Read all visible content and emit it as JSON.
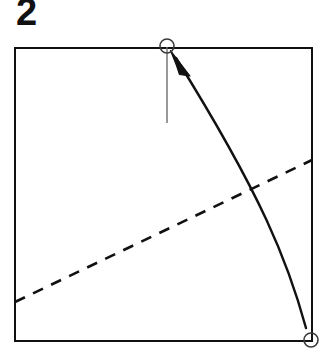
{
  "figure": {
    "step_label": "2",
    "background_color": "#ffffff",
    "ink_color": "#111111",
    "guide_color": "#777777"
  },
  "chart_data": {
    "type": "diagram",
    "coordinate_space": {
      "width": 327,
      "height": 363
    },
    "elements": [
      {
        "id": "paper-square",
        "name": "paper-square",
        "kind": "rectangle",
        "x": 15,
        "y": 48,
        "width": 297,
        "height": 293,
        "stroke": "#111111",
        "stroke_width": 2.4,
        "fill": "none"
      },
      {
        "id": "fold-line-dashed",
        "name": "dashed-fold-line",
        "kind": "line",
        "x1": 15,
        "y1": 302,
        "x2": 312,
        "y2": 160,
        "stroke": "#111111",
        "stroke_width": 2.6,
        "dash_pattern": "11 9",
        "meaning": "valley fold crease"
      },
      {
        "id": "target-tick",
        "name": "alignment-tick-line",
        "kind": "line",
        "x1": 167,
        "y1": 47,
        "x2": 167,
        "y2": 123,
        "stroke": "#6e6e6e",
        "stroke_width": 1.4
      },
      {
        "id": "target-marker",
        "name": "target-point-circle",
        "kind": "circle",
        "cx": 167,
        "cy": 46,
        "r": 7,
        "stroke": "#3a3a3a",
        "stroke_width": 1.6,
        "fill": "none"
      },
      {
        "id": "source-marker",
        "name": "source-corner-circle",
        "kind": "circle",
        "cx": 311,
        "cy": 340,
        "r": 7,
        "stroke": "#3a3a3a",
        "stroke_width": 1.6,
        "fill": "none"
      },
      {
        "id": "fold-arrow",
        "name": "curved-fold-arrow",
        "kind": "curved-arrow",
        "path": "M 306 328 C 288 262, 262 196, 176 58",
        "from": [
          306,
          328
        ],
        "to": [
          176,
          58
        ],
        "control_points": [
          [
            288,
            262
          ],
          [
            262,
            196
          ]
        ],
        "stroke": "#111111",
        "stroke_width": 2.4,
        "arrowhead": {
          "tip": [
            171,
            51
          ],
          "points": "171,51 190,74 178,74 175,66",
          "fill": "#111111"
        },
        "meaning": "bring bottom-right corner up to the marked point on the top edge"
      }
    ]
  }
}
